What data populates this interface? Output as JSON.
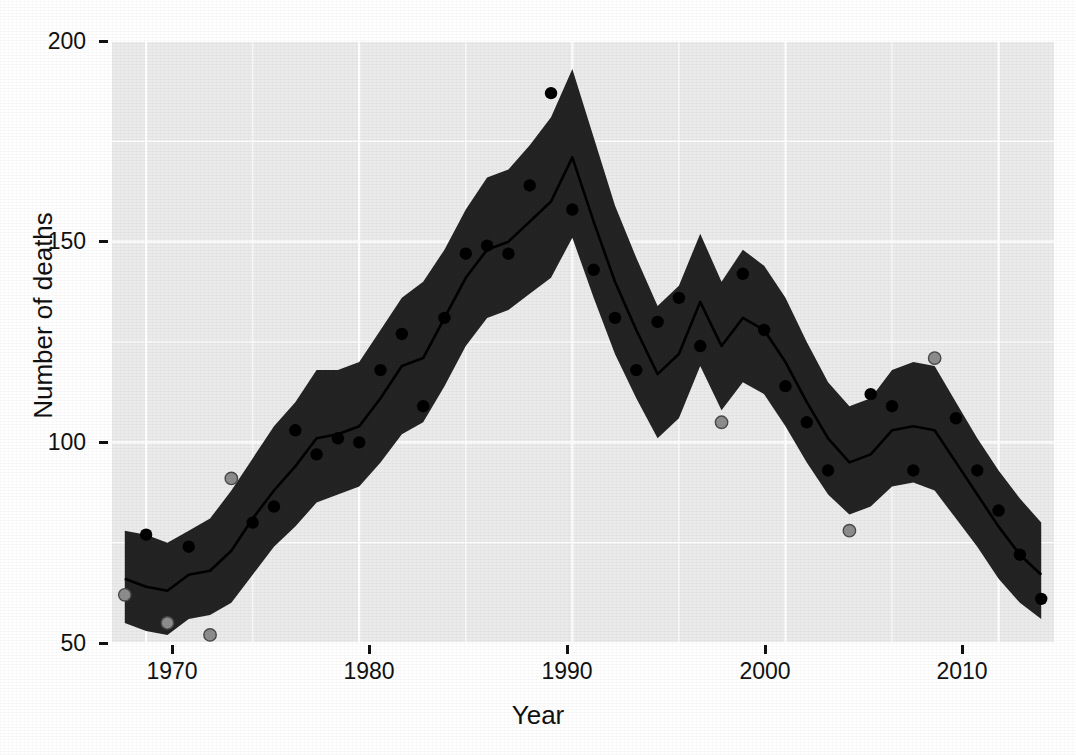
{
  "figure": {
    "caption_fragment": "",
    "background_color": "#ffffff",
    "panel_color": "#ebebeb",
    "ribbon_color": "#1c1c1c",
    "line_color": "#000000",
    "point_color": "#000000",
    "outlier_point_color": "#8d8d8d"
  },
  "axes": {
    "y_title": "Number of deaths",
    "x_title": "Year",
    "y_ticks": [
      "200",
      "150",
      "100",
      "50"
    ],
    "x_ticks": [
      "1970",
      "1980",
      "1990",
      "2000",
      "2010"
    ]
  },
  "chart_data": {
    "type": "line",
    "title": "",
    "subtitle": "",
    "xlabel": "Year",
    "ylabel": "Number of deaths",
    "xlim": [
      1968.4,
      2012.6
    ],
    "ylim": [
      50,
      200
    ],
    "y_ticks": [
      50,
      100,
      150,
      200
    ],
    "x_ticks": [
      1970,
      1980,
      1990,
      2000,
      2010
    ],
    "grid": true,
    "legend": "none",
    "x": [
      1969,
      1970,
      1971,
      1972,
      1973,
      1974,
      1975,
      1976,
      1977,
      1978,
      1979,
      1980,
      1981,
      1982,
      1983,
      1984,
      1985,
      1986,
      1987,
      1988,
      1989,
      1990,
      1991,
      1992,
      1993,
      1994,
      1995,
      1996,
      1997,
      1998,
      1999,
      2000,
      2001,
      2002,
      2003,
      2004,
      2005,
      2006,
      2007,
      2008,
      2009,
      2010,
      2011,
      2012
    ],
    "series": [
      {
        "name": "Fitted trend",
        "type": "line",
        "values": [
          66,
          64,
          63,
          67,
          68,
          73,
          81,
          88,
          94,
          101,
          102,
          104,
          111,
          119,
          121,
          131,
          141,
          148,
          150,
          155,
          160,
          171,
          155,
          140,
          128,
          117,
          122,
          135,
          124,
          131,
          128,
          120,
          110,
          101,
          95,
          97,
          103,
          104,
          103,
          95,
          87,
          79,
          72,
          67
        ]
      },
      {
        "name": "Confidence band upper",
        "type": "ribbon-upper",
        "values": [
          78,
          77,
          75,
          78,
          81,
          88,
          96,
          104,
          110,
          118,
          118,
          120,
          128,
          136,
          140,
          148,
          158,
          166,
          168,
          174,
          181,
          193,
          176,
          159,
          146,
          134,
          139,
          152,
          140,
          148,
          144,
          136,
          125,
          115,
          109,
          111,
          118,
          120,
          119,
          110,
          101,
          93,
          86,
          80
        ]
      },
      {
        "name": "Confidence band lower",
        "type": "ribbon-lower",
        "values": [
          55,
          53,
          52,
          56,
          57,
          60,
          67,
          74,
          79,
          85,
          87,
          89,
          95,
          102,
          105,
          114,
          124,
          131,
          133,
          137,
          141,
          151,
          136,
          122,
          111,
          101,
          106,
          119,
          108,
          115,
          112,
          104,
          95,
          87,
          82,
          84,
          89,
          90,
          88,
          81,
          74,
          66,
          60,
          56
        ]
      },
      {
        "name": "Observed deaths",
        "type": "points",
        "values": [
          62,
          77,
          55,
          74,
          52,
          91,
          80,
          84,
          103,
          97,
          101,
          100,
          118,
          127,
          109,
          131,
          147,
          149,
          147,
          164,
          187,
          158,
          143,
          131,
          118,
          130,
          136,
          124,
          105,
          142,
          128,
          114,
          105,
          93,
          78,
          112,
          109,
          93,
          121,
          106,
          93,
          83,
          72,
          61
        ]
      }
    ],
    "outliers": [
      {
        "x": 1969,
        "y": 62
      },
      {
        "x": 1971,
        "y": 55
      },
      {
        "x": 1973,
        "y": 52
      },
      {
        "x": 1974,
        "y": 91
      },
      {
        "x": 1997,
        "y": 105
      },
      {
        "x": 2003,
        "y": 78
      },
      {
        "x": 2007,
        "y": 121
      }
    ]
  }
}
